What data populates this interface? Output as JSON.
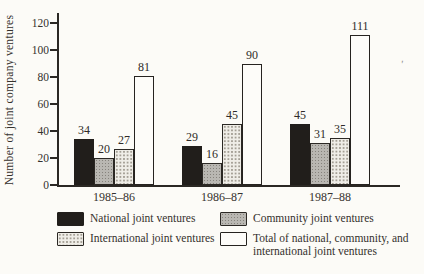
{
  "figure": {
    "background": "#fcfbf7",
    "ink": "#2f2b28"
  },
  "chart_data": {
    "type": "bar",
    "title": "",
    "xlabel": "",
    "ylabel": "Number of joint company ventures",
    "ylim": [
      0,
      120
    ],
    "yticks": [
      0,
      20,
      40,
      60,
      80,
      100,
      120
    ],
    "grid": "off",
    "legend_position": "bottom",
    "bar_value_labels_shown": true,
    "categories": [
      "1985–86",
      "1986–87",
      "1987–88"
    ],
    "series": [
      {
        "name": "National joint ventures",
        "style": "solid-black",
        "values": [
          34,
          29,
          45
        ]
      },
      {
        "name": "Community joint ventures",
        "style": "gray-stipple",
        "values": [
          20,
          16,
          31
        ]
      },
      {
        "name": "International joint ventures",
        "style": "light-stipple",
        "values": [
          27,
          45,
          35
        ]
      },
      {
        "name": "Total of national, community, and international joint ventures",
        "style": "white-outline",
        "values": [
          81,
          90,
          111
        ]
      }
    ]
  },
  "artifact": {
    "glyph": "'"
  }
}
